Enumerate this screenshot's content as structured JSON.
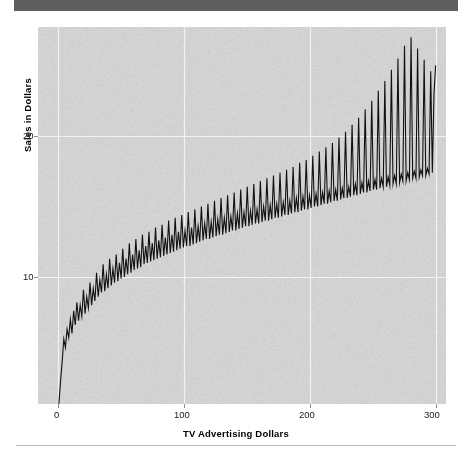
{
  "page": {
    "background": "#ffffff",
    "top_bar_color": "#5e5e5e",
    "rule_color": "#b9b9b9"
  },
  "chart_data": {
    "type": "line",
    "title": "",
    "subtitle": "",
    "xlabel": "TV Advertising Dollars",
    "ylabel": "Sales in Dollars",
    "xlim": [
      -6,
      306
    ],
    "ylim": [
      0.5,
      28.5
    ],
    "xticks": [
      0,
      100,
      200,
      300
    ],
    "xticklabels": [
      "0",
      "100",
      "200",
      "300"
    ],
    "yticks": [
      10,
      20
    ],
    "yticklabels": [
      "10",
      "20"
    ],
    "grid": true,
    "grid_color": "#f2f2f2",
    "plot_background": "#d2d2d2",
    "line_color": "#111111",
    "line_width": 1.1,
    "legend": null,
    "annotations": [],
    "series": [
      {
        "name": "Sales",
        "x": [
          0.7,
          2.0,
          3.3,
          4.6,
          5.9,
          7.2,
          8.5,
          9.8,
          11.1,
          12.4,
          13.7,
          15.0,
          16.3,
          17.6,
          18.9,
          20.2,
          21.5,
          22.8,
          24.1,
          25.4,
          26.7,
          28.0,
          29.3,
          30.6,
          31.9,
          33.2,
          34.5,
          35.8,
          37.1,
          38.4,
          39.7,
          41.0,
          42.3,
          43.6,
          44.9,
          46.2,
          47.5,
          48.8,
          50.1,
          51.4,
          52.7,
          54.0,
          55.3,
          56.6,
          57.9,
          59.2,
          60.5,
          61.8,
          63.1,
          64.4,
          65.7,
          67.0,
          68.3,
          69.6,
          70.9,
          72.2,
          73.5,
          74.8,
          76.1,
          77.4,
          78.7,
          80.0,
          81.3,
          82.6,
          83.9,
          85.2,
          86.5,
          87.8,
          89.1,
          90.4,
          91.7,
          93.0,
          94.3,
          95.6,
          96.9,
          98.2,
          99.5,
          100.8,
          102.1,
          103.4,
          104.7,
          106.0,
          107.3,
          108.6,
          109.9,
          111.2,
          112.5,
          113.8,
          115.1,
          116.4,
          117.7,
          119.0,
          120.3,
          121.6,
          122.9,
          124.2,
          125.5,
          126.8,
          128.1,
          129.4,
          130.7,
          132.0,
          133.3,
          134.6,
          135.9,
          137.2,
          138.5,
          139.8,
          141.1,
          142.4,
          143.7,
          145.0,
          146.3,
          147.6,
          148.9,
          150.2,
          151.5,
          152.8,
          154.1,
          155.4,
          156.7,
          158.0,
          159.3,
          160.6,
          161.9,
          163.2,
          164.5,
          165.8,
          167.1,
          168.4,
          169.7,
          171.0,
          172.3,
          173.6,
          174.9,
          176.2,
          177.5,
          178.8,
          180.1,
          181.4,
          182.7,
          184.0,
          185.3,
          186.6,
          187.9,
          189.2,
          190.5,
          191.8,
          193.1,
          194.4,
          195.7,
          197.0,
          198.3,
          199.6,
          200.9,
          202.2,
          203.5,
          204.8,
          206.1,
          207.4,
          208.7,
          210.0,
          211.3,
          212.6,
          213.9,
          215.2,
          216.5,
          217.8,
          219.1,
          220.4,
          221.7,
          223.0,
          224.3,
          225.6,
          226.9,
          228.2,
          229.5,
          230.8,
          232.1,
          233.4,
          234.7,
          236.0,
          237.3,
          238.6,
          239.9,
          241.2,
          242.5,
          243.8,
          245.1,
          246.4,
          247.7,
          249.0,
          250.3,
          251.6,
          252.9,
          254.2,
          255.5,
          256.8,
          258.1,
          259.4,
          260.7,
          262.0,
          263.3,
          264.6,
          265.9,
          267.2,
          268.5,
          269.8,
          271.1,
          272.4,
          273.7,
          275.0,
          276.3,
          277.6,
          278.9,
          280.2,
          281.5,
          282.8,
          284.1,
          285.4,
          286.7,
          288.0,
          289.3,
          290.6,
          291.9,
          293.2,
          294.5,
          295.8,
          297.1,
          298.4,
          299.7
        ],
        "y": [
          1.0,
          2.6,
          4.0,
          5.6,
          5.0,
          6.3,
          5.7,
          7.0,
          6.0,
          7.6,
          6.6,
          8.2,
          6.9,
          8.0,
          7.2,
          9.1,
          7.4,
          8.6,
          7.8,
          9.6,
          8.0,
          9.2,
          8.3,
          10.3,
          8.6,
          9.8,
          8.9,
          10.9,
          9.0,
          10.2,
          9.2,
          11.3,
          9.4,
          10.6,
          9.6,
          11.6,
          9.7,
          11.0,
          9.9,
          12.0,
          10.0,
          11.3,
          10.2,
          12.4,
          10.3,
          11.6,
          10.5,
          12.7,
          10.6,
          11.9,
          10.7,
          13.0,
          10.9,
          12.2,
          11.0,
          13.2,
          11.1,
          12.4,
          11.2,
          13.5,
          11.3,
          12.6,
          11.4,
          13.7,
          11.5,
          12.8,
          11.6,
          14.0,
          11.7,
          13.0,
          11.8,
          14.2,
          11.9,
          13.2,
          12.0,
          14.4,
          12.1,
          13.3,
          12.2,
          14.6,
          12.2,
          13.5,
          12.3,
          14.8,
          12.4,
          13.6,
          12.5,
          15.0,
          12.6,
          13.8,
          12.7,
          15.2,
          12.7,
          13.9,
          12.8,
          15.4,
          12.9,
          14.1,
          13.0,
          15.6,
          13.0,
          14.2,
          13.1,
          15.8,
          13.2,
          14.3,
          13.3,
          16.0,
          13.3,
          14.5,
          13.4,
          16.2,
          13.5,
          14.6,
          13.6,
          16.4,
          13.6,
          14.7,
          13.7,
          16.6,
          13.8,
          14.8,
          13.8,
          16.8,
          13.9,
          15.0,
          14.0,
          17.0,
          14.0,
          15.1,
          14.1,
          17.2,
          14.2,
          15.2,
          14.2,
          17.4,
          14.3,
          15.3,
          14.4,
          17.6,
          14.4,
          15.4,
          14.5,
          17.8,
          14.6,
          15.6,
          14.6,
          18.1,
          14.7,
          15.7,
          14.8,
          18.3,
          14.8,
          15.8,
          14.9,
          18.6,
          15.0,
          15.9,
          15.0,
          18.9,
          15.1,
          16.0,
          15.2,
          19.2,
          15.2,
          16.1,
          15.3,
          19.5,
          15.4,
          16.2,
          15.4,
          19.9,
          15.5,
          16.3,
          15.6,
          20.3,
          15.6,
          16.4,
          15.7,
          20.8,
          15.8,
          16.6,
          15.8,
          21.3,
          15.9,
          16.7,
          16.0,
          21.9,
          16.0,
          16.8,
          16.1,
          22.5,
          16.2,
          16.9,
          16.2,
          23.2,
          16.3,
          17.0,
          16.4,
          23.9,
          16.4,
          17.1,
          16.5,
          24.7,
          16.6,
          17.2,
          16.6,
          25.5,
          16.7,
          17.3,
          16.8,
          26.4,
          16.8,
          17.4,
          16.9,
          27.0,
          17.0,
          17.5,
          17.0,
          26.2,
          17.1,
          17.6,
          17.2,
          25.4,
          17.2,
          17.7,
          17.3,
          24.6,
          17.4,
          23.0,
          25.0
        ]
      }
    ]
  },
  "axes": {
    "ylabel_text": "Sales in Dollars",
    "xlabel_text": "TV Advertising Dollars",
    "y_tick_20": "20",
    "y_tick_10": "10",
    "x_tick_0": "0",
    "x_tick_100": "100",
    "x_tick_200": "200",
    "x_tick_300": "300"
  }
}
